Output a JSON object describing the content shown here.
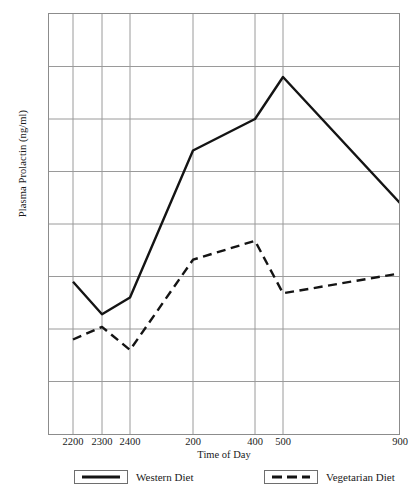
{
  "chart_data": {
    "type": "line",
    "title": "",
    "xlabel": "Time of Day",
    "ylabel": "Plasma Prolactin (ng/ml)",
    "x": [
      "2200",
      "2300",
      "2400",
      "200",
      "400",
      "500",
      "900"
    ],
    "x_positions": [
      73,
      102,
      130,
      193,
      255,
      283,
      400
    ],
    "categories": [
      "2200",
      "2300",
      "2400",
      "200",
      "400",
      "500",
      "900"
    ],
    "series": [
      {
        "name": "Western Diet",
        "style": "solid",
        "color": "#141414",
        "values": [
          14.5,
          11.4,
          13.0,
          27.0,
          30.0,
          34.0,
          22.0
        ]
      },
      {
        "name": "Vegetarian Diet",
        "style": "dashed",
        "color": "#141414",
        "values": [
          9.0,
          10.2,
          8.0,
          16.6,
          18.4,
          13.4,
          15.3
        ]
      }
    ],
    "ylim": [
      0,
      40
    ],
    "yticks": [
      0,
      5,
      10,
      15,
      20,
      25,
      30,
      35,
      40
    ],
    "ytick_labels": [
      "0",
      "5",
      "10",
      "15",
      "20",
      "25",
      "30",
      "35",
      "40"
    ],
    "grid": true,
    "grid_color": "#9a9a9a",
    "axis_color": "#8c8c8c",
    "legend_position": "bottom",
    "legend": [
      {
        "label": "Western Diet",
        "style": "solid"
      },
      {
        "label": "Vegetarian Diet",
        "style": "dashed"
      }
    ]
  }
}
